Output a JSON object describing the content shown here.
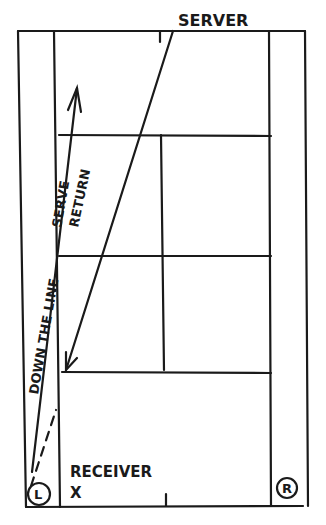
{
  "diagram": {
    "labels": {
      "server": "SERVER",
      "receiver": "RECEIVER",
      "receiver_mark": "X",
      "serve": "SERVE",
      "return": "RETURN",
      "down_the_line": "DOWN THE LINE",
      "left_marker": "L",
      "right_marker": "R"
    },
    "colors": {
      "ink": "#1a1a1a",
      "paper": "#ffffff"
    }
  }
}
